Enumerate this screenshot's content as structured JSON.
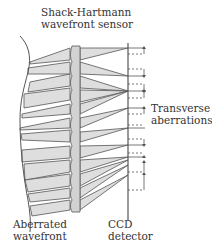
{
  "labels": {
    "sensor": [
      "Shack-Hartmann",
      "wavefront sensor"
    ],
    "transverse": [
      "Transverse",
      "aberrations"
    ],
    "wavefront": [
      "Aberrated",
      "wavefront"
    ],
    "ccd": [
      "CCD",
      "detector"
    ]
  },
  "colors": {
    "line": "#555555",
    "beam_fill": "#dedede",
    "lenslet_fill": "#d2d2d2",
    "text": "#333333"
  },
  "components": [
    {
      "name": "Aberrated wavefront",
      "type": "curve"
    },
    {
      "name": "Shack-Hartmann wavefront sensor",
      "type": "lenslet-array"
    },
    {
      "name": "CCD detector",
      "type": "detector-plane"
    },
    {
      "name": "Transverse aberrations",
      "type": "spot-displacement-annotation"
    }
  ]
}
